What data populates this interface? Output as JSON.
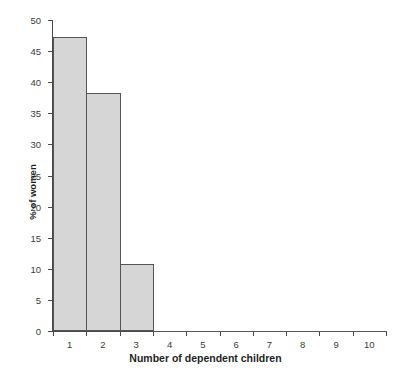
{
  "chart_data": {
    "type": "bar",
    "title": "",
    "xlabel": "Number of dependent children",
    "ylabel": "% of women",
    "categories": [
      "1",
      "2",
      "3",
      "4",
      "5",
      "6",
      "7",
      "8",
      "9",
      "10"
    ],
    "values": [
      47.3,
      38.3,
      10.8,
      0,
      0,
      0,
      0,
      0,
      0,
      0
    ],
    "ylim": [
      0,
      50
    ],
    "xlim": [
      0,
      10
    ],
    "ytick_labels": [
      "0",
      "5",
      "10",
      "15",
      "20",
      "25",
      "30",
      "35",
      "40",
      "45",
      "50"
    ],
    "ytick_values": [
      0,
      5,
      10,
      15,
      20,
      25,
      30,
      35,
      40,
      45,
      50
    ],
    "xtick_labels": [
      "1",
      "2",
      "3",
      "4",
      "5",
      "6",
      "7",
      "8",
      "9",
      "10"
    ],
    "grid": false,
    "legend": false,
    "bar_fill_color": "#d6d6d6",
    "bar_edge_color": "#545454",
    "axis_color": "#4a4a4a",
    "text_color": "#1f1f1f"
  }
}
